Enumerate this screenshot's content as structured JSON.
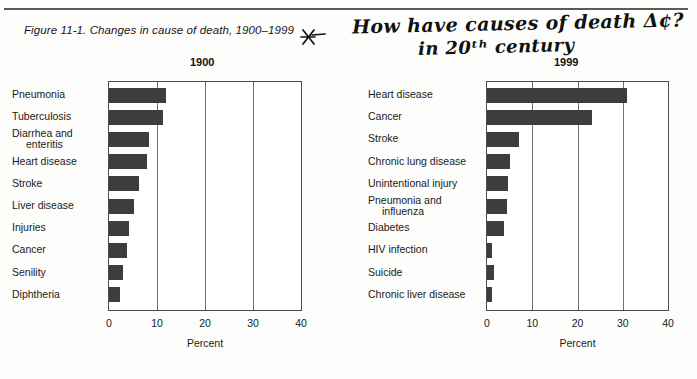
{
  "figure": {
    "caption": "Figure 11-1. Changes in cause of death, 1900–1999",
    "star_mark": "star-asterisk-mark"
  },
  "annotation": {
    "line1": "How have causes of death Δ¢?",
    "line2": "in 20ᵗʰ century"
  },
  "chart_data": [
    {
      "type": "bar",
      "title": "1900",
      "orientation": "horizontal",
      "xlabel": "Percent",
      "ylabel": "",
      "xlim": [
        0,
        40
      ],
      "xticks": [
        "0",
        "10",
        "20",
        "30",
        "40"
      ],
      "grid": true,
      "legend": "none",
      "categories": [
        "Pneumonia",
        "Tuberculosis",
        "Diarrhea and\nenteritis",
        "Heart disease",
        "Stroke",
        "Liver disease",
        "Injuries",
        "Cancer",
        "Senility",
        "Diphtheria"
      ],
      "values": [
        11.8,
        11.3,
        8.3,
        8.0,
        6.2,
        5.2,
        4.2,
        3.7,
        2.9,
        2.3
      ]
    },
    {
      "type": "bar",
      "title": "1999",
      "orientation": "horizontal",
      "xlabel": "Percent",
      "ylabel": "",
      "xlim": [
        0,
        40
      ],
      "xticks": [
        "0",
        "10",
        "20",
        "30",
        "40"
      ],
      "grid": true,
      "legend": "none",
      "categories": [
        "Heart disease",
        "Cancer",
        "Stroke",
        "Chronic lung disease",
        "Unintentional injury",
        "Pneumonia and\ninfluenza",
        "Diabetes",
        "HIV infection",
        "Suicide",
        "Chronic liver disease"
      ],
      "values": [
        31.0,
        23.2,
        7.0,
        5.0,
        4.6,
        4.4,
        3.8,
        1.2,
        1.5,
        1.2
      ]
    }
  ],
  "colors": {
    "bar": "#3d3d3d",
    "axis": "#4d4d4d",
    "grid": "#707070",
    "rule": "#5a5a5a",
    "text": "#1a1a1a",
    "background": "#fdfdfc"
  }
}
